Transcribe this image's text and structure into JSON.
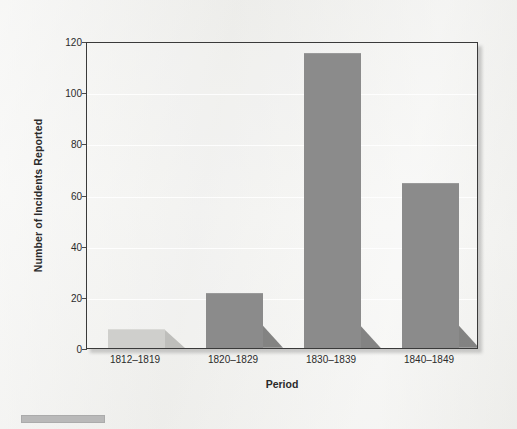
{
  "chart_data": {
    "type": "bar",
    "title": "",
    "xlabel": "Period",
    "ylabel": "Number of Incidents Reported",
    "categories": [
      "1812–1819",
      "1820–1829",
      "1830–1839",
      "1840–1849"
    ],
    "values": [
      7,
      21,
      115,
      64
    ],
    "ylim": [
      0,
      120
    ],
    "yticks": [
      0,
      20,
      40,
      60,
      80,
      100,
      120
    ],
    "ytick_labels": [
      "0",
      "20",
      "40",
      "60",
      "80",
      "100",
      "120"
    ],
    "grid": true,
    "legend": "none",
    "bar_colors": [
      "#cfcfcc",
      "#8b8b8b",
      "#8b8b8b",
      "#8b8b8b"
    ],
    "series": [
      {
        "name": "Number of Incidents Reported",
        "values": [
          7,
          21,
          115,
          64
        ]
      }
    ]
  },
  "figure": {
    "background_color": "#eeeeec",
    "plot_border_color": "#3a3a3a",
    "gridline_color": "#ffffff",
    "caption_bar_color": "#b9b9b9"
  }
}
